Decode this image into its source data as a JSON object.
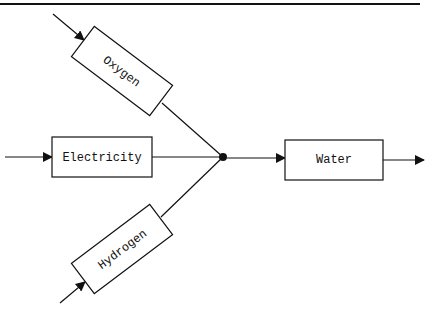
{
  "diagram": {
    "type": "flow",
    "inputs": [
      {
        "id": "oxygen",
        "label": "Oxygen"
      },
      {
        "id": "electricity",
        "label": "Electricity"
      },
      {
        "id": "hydrogen",
        "label": "Hydrogen"
      }
    ],
    "output": {
      "id": "water",
      "label": "Water"
    },
    "edges": [
      {
        "from": "oxygen",
        "to": "junction"
      },
      {
        "from": "electricity",
        "to": "junction"
      },
      {
        "from": "hydrogen",
        "to": "junction"
      },
      {
        "from": "junction",
        "to": "water"
      }
    ],
    "colors": {
      "stroke": "#111111",
      "background": "#ffffff"
    }
  }
}
